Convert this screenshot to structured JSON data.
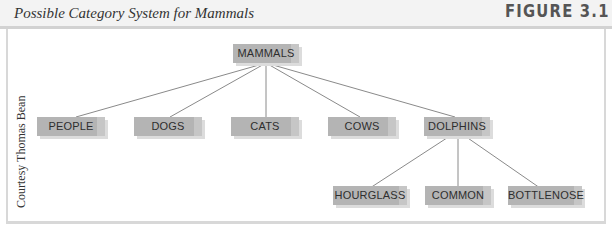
{
  "header": {
    "caption": "Possible Category System for Mammals",
    "figure_label": "FIGURE 3.1"
  },
  "credit": "Courtesy Thomas Bean",
  "diagram": {
    "root": "MAMMALS",
    "level1": [
      "PEOPLE",
      "DOGS",
      "CATS",
      "COWS",
      "DOLPHINS"
    ],
    "dolphins_children": [
      "HOURGLASS",
      "COMMON",
      "BOTTLENOSE"
    ]
  },
  "colors": {
    "node_fill": "#b4b4b4",
    "line": "#808080",
    "header_bg": "#f3f3f3"
  }
}
